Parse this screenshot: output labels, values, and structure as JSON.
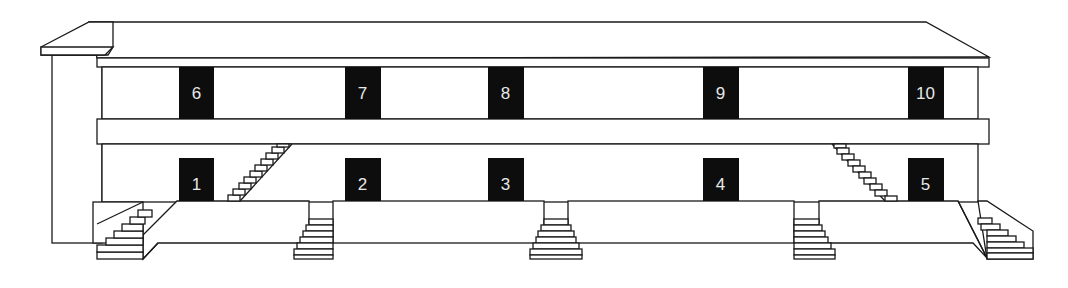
{
  "diagram": {
    "type": "building-elevation",
    "colors": {
      "line": "#1a1a1a",
      "door": "#0d0d0d",
      "door_label": "#e8e8e8",
      "background": "#ffffff"
    },
    "upper_floor": {
      "doors": [
        {
          "label": "6"
        },
        {
          "label": "7"
        },
        {
          "label": "8"
        },
        {
          "label": "9"
        },
        {
          "label": "10"
        }
      ]
    },
    "lower_floor": {
      "doors": [
        {
          "label": "1"
        },
        {
          "label": "2"
        },
        {
          "label": "3"
        },
        {
          "label": "4"
        },
        {
          "label": "5"
        }
      ]
    },
    "staircases": {
      "to_upper_floor": 2,
      "to_ground": 5
    }
  }
}
